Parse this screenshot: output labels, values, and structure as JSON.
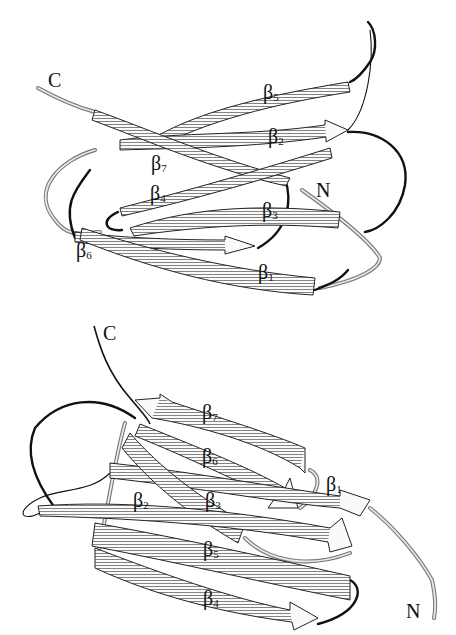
{
  "figure": {
    "type": "protein ribbon diagram"
  },
  "panels": [
    {
      "id": "top",
      "termini": {
        "n": "N",
        "c": "C"
      },
      "strands": [
        {
          "greek": "β",
          "num": "1"
        },
        {
          "greek": "β",
          "num": "2"
        },
        {
          "greek": "β",
          "num": "3"
        },
        {
          "greek": "β",
          "num": "4"
        },
        {
          "greek": "β",
          "num": "5"
        },
        {
          "greek": "β",
          "num": "6"
        },
        {
          "greek": "β",
          "num": "7"
        }
      ]
    },
    {
      "id": "bottom",
      "termini": {
        "n": "N",
        "c": "C"
      },
      "strands": [
        {
          "greek": "β",
          "num": "1"
        },
        {
          "greek": "β",
          "num": "2"
        },
        {
          "greek": "β",
          "num": "3"
        },
        {
          "greek": "β",
          "num": "4"
        },
        {
          "greek": "β",
          "num": "5"
        },
        {
          "greek": "β",
          "num": "6"
        },
        {
          "greek": "β",
          "num": "7"
        }
      ]
    }
  ],
  "colors": {
    "strand_fill": "#fafafa",
    "outline": "#111111",
    "coil": "#111111",
    "terminus_tube": "#777777"
  }
}
